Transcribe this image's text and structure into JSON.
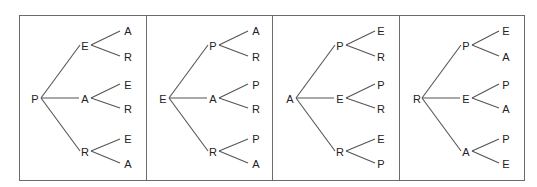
{
  "diagram": {
    "type": "tree-diagram-set",
    "panels": [
      {
        "root": "P",
        "branches": [
          {
            "node": "E",
            "leaves": [
              "A",
              "R"
            ]
          },
          {
            "node": "A",
            "leaves": [
              "E",
              "R"
            ]
          },
          {
            "node": "R",
            "leaves": [
              "E",
              "A"
            ]
          }
        ]
      },
      {
        "root": "E",
        "branches": [
          {
            "node": "P",
            "leaves": [
              "A",
              "R"
            ]
          },
          {
            "node": "A",
            "leaves": [
              "P",
              "R"
            ]
          },
          {
            "node": "R",
            "leaves": [
              "P",
              "A"
            ]
          }
        ]
      },
      {
        "root": "A",
        "branches": [
          {
            "node": "P",
            "leaves": [
              "E",
              "R"
            ]
          },
          {
            "node": "E",
            "leaves": [
              "P",
              "R"
            ]
          },
          {
            "node": "R",
            "leaves": [
              "E",
              "P"
            ]
          }
        ]
      },
      {
        "root": "R",
        "branches": [
          {
            "node": "P",
            "leaves": [
              "E",
              "A"
            ]
          },
          {
            "node": "E",
            "leaves": [
              "P",
              "A"
            ]
          },
          {
            "node": "A",
            "leaves": [
              "P",
              "E"
            ]
          }
        ]
      }
    ],
    "colors": {
      "line": "#555555",
      "border": "#6b6b6b",
      "text": "#222222",
      "background": "#ffffff"
    }
  }
}
